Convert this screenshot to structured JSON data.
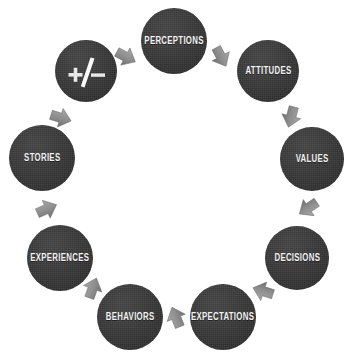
{
  "diagram": {
    "type": "circular-cycle",
    "direction": "clockwise",
    "background_color": "#ffffff",
    "node_color": "#393939",
    "label_color": "#f2f2f2",
    "arrow_color": "#8c8c8c",
    "nodes": [
      {
        "id": "plusminus",
        "label": "+/−",
        "icon": "plus-minus-icon",
        "cx": 86,
        "cy": 71,
        "r": 31,
        "font_size": 9
      },
      {
        "id": "perceptions",
        "label": "PERCEPTIONS",
        "cx": 174,
        "cy": 41,
        "r": 33,
        "font_size": 10
      },
      {
        "id": "attitudes",
        "label": "ATTITUDES",
        "cx": 268,
        "cy": 71,
        "r": 31,
        "font_size": 10
      },
      {
        "id": "values",
        "label": "VALUES",
        "cx": 312,
        "cy": 159,
        "r": 32,
        "font_size": 10
      },
      {
        "id": "decisions",
        "label": "DECISIONS",
        "cx": 297,
        "cy": 258,
        "r": 32,
        "font_size": 10
      },
      {
        "id": "expectations",
        "label": "EXPECTATIONS",
        "cx": 223,
        "cy": 317,
        "r": 33,
        "font_size": 10
      },
      {
        "id": "behaviors",
        "label": "BEHAVIORS",
        "cx": 130,
        "cy": 317,
        "r": 33,
        "font_size": 10
      },
      {
        "id": "experiences",
        "label": "EXPERIENCES",
        "cx": 60,
        "cy": 258,
        "r": 33,
        "font_size": 10
      },
      {
        "id": "stories",
        "label": "STORIES",
        "cx": 42,
        "cy": 158,
        "r": 33,
        "font_size": 10
      }
    ],
    "arrows": [
      {
        "id": "arrow-plusminus-to-perceptions",
        "from": "plusminus",
        "to": "perceptions",
        "x": 113,
        "y": 44,
        "rotation": 28
      },
      {
        "id": "arrow-perceptions-to-attitudes",
        "from": "perceptions",
        "to": "attitudes",
        "x": 208,
        "y": 44,
        "rotation": 62
      },
      {
        "id": "arrow-attitudes-to-values",
        "from": "attitudes",
        "to": "values",
        "x": 278,
        "y": 104,
        "rotation": 105
      },
      {
        "id": "arrow-values-to-decisions",
        "from": "values",
        "to": "decisions",
        "x": 295,
        "y": 195,
        "rotation": 146
      },
      {
        "id": "arrow-decisions-to-expectations",
        "from": "decisions",
        "to": "expectations",
        "x": 250,
        "y": 278,
        "rotation": 198
      },
      {
        "id": "arrow-expectations-to-behaviors",
        "from": "expectations",
        "to": "behaviors",
        "x": 163,
        "y": 304,
        "rotation": 248
      },
      {
        "id": "arrow-behaviors-to-experiences",
        "from": "behaviors",
        "to": "experiences",
        "x": 80,
        "y": 275,
        "rotation": 290
      },
      {
        "id": "arrow-experiences-to-stories",
        "from": "experiences",
        "to": "stories",
        "x": 34,
        "y": 196,
        "rotation": 336
      },
      {
        "id": "arrow-stories-to-plusminus",
        "from": "stories",
        "to": "plusminus",
        "x": 48,
        "y": 105,
        "rotation": 17
      }
    ]
  }
}
